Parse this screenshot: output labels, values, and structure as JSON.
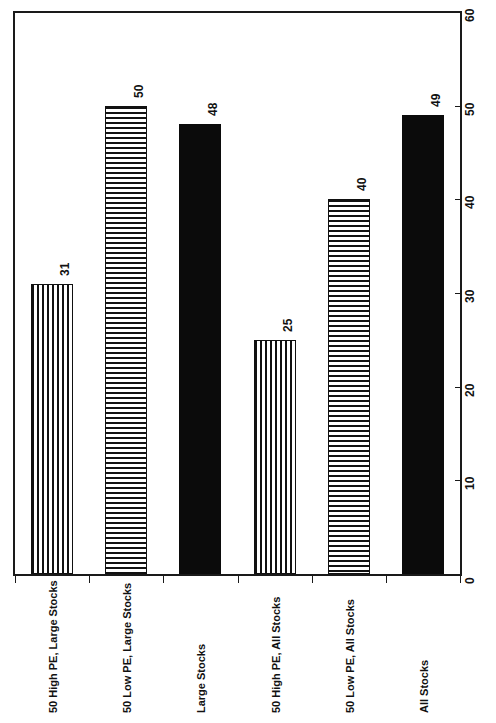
{
  "chart_data": {
    "type": "bar",
    "title": "",
    "subtitle": "",
    "xlabel": "",
    "ylabel": "",
    "orientation": "vertical-bars-rotated-page",
    "grid": false,
    "legend": "none",
    "ylim": [
      0,
      60
    ],
    "yticks": [
      0,
      10,
      20,
      30,
      40,
      50,
      60
    ],
    "ytick_labels": [
      "0",
      "10",
      "20",
      "30",
      "40",
      "50",
      "60"
    ],
    "value_axis_position": "right",
    "categories": [
      "50 High PE, Large Stocks",
      "50 Low PE, Large Stocks",
      "Large Stocks",
      "50 High PE, All Stocks",
      "50 Low PE, All Stocks",
      "All Stocks"
    ],
    "values": [
      31,
      50,
      48,
      25,
      40,
      49
    ],
    "value_labels": [
      "31",
      "50",
      "48",
      "25",
      "40",
      "49"
    ],
    "patterns": [
      "vertical-stripe",
      "horizontal-stripe",
      "solid",
      "vertical-stripe",
      "horizontal-stripe",
      "solid"
    ],
    "colors": {
      "bar_ink": "#111111",
      "bar_solid": "#0b0b0b",
      "bar_ground": "#ffffff",
      "axis": "#1a1a1a",
      "text": "#111111",
      "background": "#ffffff"
    }
  },
  "axis": {
    "ticks": [
      {
        "label": "60",
        "value": 60
      },
      {
        "label": "50",
        "value": 50
      },
      {
        "label": "40",
        "value": 40
      },
      {
        "label": "30",
        "value": 30
      },
      {
        "label": "20",
        "value": 20
      },
      {
        "label": "10",
        "value": 10
      },
      {
        "label": "0",
        "value": 0
      }
    ]
  },
  "bars": [
    {
      "label": "50 High PE, Large Stocks",
      "value": 31,
      "value_label": "31",
      "pattern": "vertical-stripe"
    },
    {
      "label": "50 Low PE, Large Stocks",
      "value": 50,
      "value_label": "50",
      "pattern": "horizontal-stripe"
    },
    {
      "label": "Large Stocks",
      "value": 48,
      "value_label": "48",
      "pattern": "solid"
    },
    {
      "label": "50 High PE, All Stocks",
      "value": 25,
      "value_label": "25",
      "pattern": "vertical-stripe"
    },
    {
      "label": "50 Low PE, All Stocks",
      "value": 40,
      "value_label": "40",
      "pattern": "horizontal-stripe"
    },
    {
      "label": "All Stocks",
      "value": 49,
      "value_label": "49",
      "pattern": "solid"
    }
  ]
}
